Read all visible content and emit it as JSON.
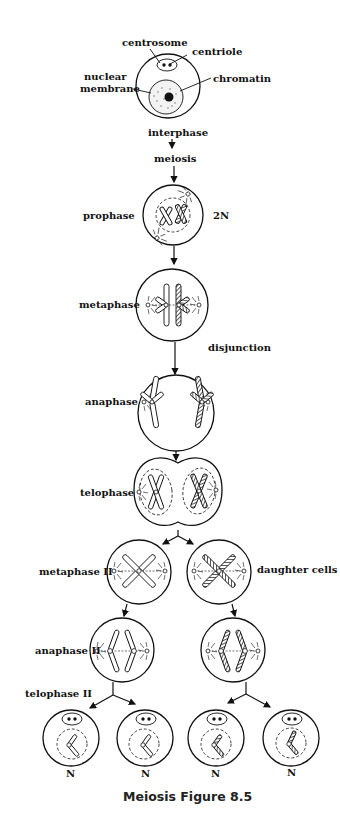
{
  "figure": {
    "caption": "Meiosis Figure 8.5",
    "labels": {
      "centrosome": "centrosome",
      "centriole": "centriole",
      "nuclear_membrane_line1": "nuclear",
      "nuclear_membrane_line2": "membrane",
      "chromatin": "chromatin",
      "interphase": "interphase",
      "meiosis": "meiosis",
      "prophase": "prophase",
      "ploidy_2n": "2N",
      "metaphase": "metaphase",
      "disjunction": "disjunction",
      "anaphase": "anaphase",
      "telophase": "telophase",
      "metaphase_ii": "metaphase II",
      "daughter_cells": "daughter cells",
      "anaphase_ii": "anaphase II",
      "telophase_ii": "telophase II"
    },
    "haploid_labels": [
      "N",
      "N",
      "N",
      "N"
    ],
    "stages": [
      {
        "name": "interphase",
        "cells": 1
      },
      {
        "name": "prophase",
        "cells": 1,
        "ploidy": "2N"
      },
      {
        "name": "metaphase",
        "cells": 1
      },
      {
        "name": "anaphase",
        "cells": 1
      },
      {
        "name": "telophase",
        "cells": 2
      },
      {
        "name": "metaphase II",
        "cells": 2
      },
      {
        "name": "anaphase II",
        "cells": 2
      },
      {
        "name": "telophase II",
        "cells": 4,
        "ploidy": "N"
      }
    ]
  }
}
